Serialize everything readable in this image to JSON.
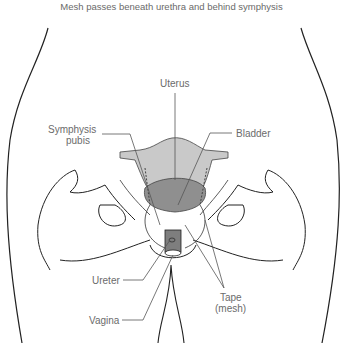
{
  "title": "Mesh passes beneath urethra and behind symphysis",
  "labels": {
    "uterus": "Uterus",
    "symphysis_line1": "Symphysis",
    "symphysis_line2": "pubis",
    "bladder": "Bladder",
    "ureter": "Ureter",
    "vagina": "Vagina",
    "tape_line1": "Tape",
    "tape_line2": "(mesh)"
  },
  "colors": {
    "uterus_fill": "#c9c9c9",
    "bladder_fill": "#8f8f8f",
    "vagina_fill": "#7e7e7e",
    "outline": "#222222",
    "leader": "#555555",
    "label_text": "#6b6b6b"
  }
}
